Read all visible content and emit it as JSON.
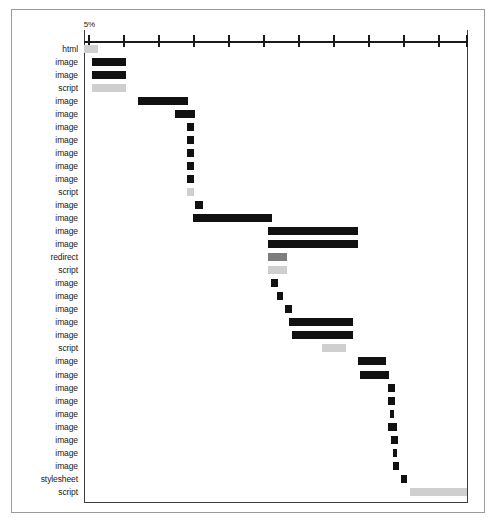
{
  "chart_data": {
    "type": "bar",
    "title": "",
    "subtitle": "",
    "xlabel": "",
    "ylabel": "",
    "orientation": "horizontal",
    "style": "waterfall-gantt",
    "grid": false,
    "legend": null,
    "axis": {
      "position": "top",
      "tick_labels": [
        "5%"
      ],
      "labeled_tick_index": 0,
      "tick_count": 12,
      "tick_positions_pct": [
        1.0,
        10.1,
        19.3,
        28.4,
        37.5,
        46.6,
        55.7,
        64.8,
        74.0,
        83.1,
        92.2,
        99.5
      ],
      "xlim_pct": [
        0,
        100
      ]
    },
    "categories": [
      "html",
      "image",
      "image",
      "script",
      "image",
      "image",
      "image",
      "image",
      "image",
      "image",
      "image",
      "script",
      "image",
      "image",
      "image",
      "image",
      "redirect",
      "script",
      "image",
      "image",
      "image",
      "image",
      "image",
      "script",
      "image",
      "image",
      "image",
      "image",
      "image",
      "image",
      "image",
      "image",
      "image",
      "stylesheet",
      "script"
    ],
    "series": [
      {
        "name": "resource timing",
        "units": "percent of total page load time",
        "bars": [
          {
            "label": "html",
            "start_pct": 0.0,
            "end_pct": 3.6,
            "color": "#cfcfcf",
            "shade": "light"
          },
          {
            "label": "image",
            "start_pct": 2.1,
            "end_pct": 11.0,
            "color": "#111111",
            "shade": "dark"
          },
          {
            "label": "image",
            "start_pct": 2.1,
            "end_pct": 11.0,
            "color": "#111111",
            "shade": "dark"
          },
          {
            "label": "script",
            "start_pct": 2.1,
            "end_pct": 11.0,
            "color": "#cfcfcf",
            "shade": "light"
          },
          {
            "label": "image",
            "start_pct": 14.1,
            "end_pct": 27.1,
            "color": "#111111",
            "shade": "dark"
          },
          {
            "label": "image",
            "start_pct": 23.7,
            "end_pct": 28.9,
            "color": "#111111",
            "shade": "dark"
          },
          {
            "label": "image",
            "start_pct": 26.8,
            "end_pct": 28.6,
            "color": "#111111",
            "shade": "dark"
          },
          {
            "label": "image",
            "start_pct": 26.8,
            "end_pct": 28.6,
            "color": "#111111",
            "shade": "dark"
          },
          {
            "label": "image",
            "start_pct": 26.8,
            "end_pct": 28.6,
            "color": "#111111",
            "shade": "dark"
          },
          {
            "label": "image",
            "start_pct": 26.8,
            "end_pct": 28.6,
            "color": "#111111",
            "shade": "dark"
          },
          {
            "label": "image",
            "start_pct": 26.8,
            "end_pct": 28.6,
            "color": "#111111",
            "shade": "dark"
          },
          {
            "label": "script",
            "start_pct": 26.8,
            "end_pct": 28.6,
            "color": "#cfcfcf",
            "shade": "light"
          },
          {
            "label": "image",
            "start_pct": 28.9,
            "end_pct": 31.0,
            "color": "#111111",
            "shade": "dark"
          },
          {
            "label": "image",
            "start_pct": 28.4,
            "end_pct": 49.0,
            "color": "#111111",
            "shade": "dark"
          },
          {
            "label": "image",
            "start_pct": 47.9,
            "end_pct": 71.4,
            "color": "#111111",
            "shade": "dark"
          },
          {
            "label": "image",
            "start_pct": 47.9,
            "end_pct": 71.4,
            "color": "#111111",
            "shade": "dark"
          },
          {
            "label": "redirect",
            "start_pct": 47.9,
            "end_pct": 52.9,
            "color": "#7d7d7d",
            "shade": "mid"
          },
          {
            "label": "script",
            "start_pct": 47.9,
            "end_pct": 52.9,
            "color": "#cfcfcf",
            "shade": "light"
          },
          {
            "label": "image",
            "start_pct": 48.7,
            "end_pct": 50.5,
            "color": "#111111",
            "shade": "dark"
          },
          {
            "label": "image",
            "start_pct": 50.3,
            "end_pct": 51.8,
            "color": "#111111",
            "shade": "dark"
          },
          {
            "label": "image",
            "start_pct": 52.3,
            "end_pct": 54.2,
            "color": "#111111",
            "shade": "dark"
          },
          {
            "label": "image",
            "start_pct": 53.4,
            "end_pct": 70.1,
            "color": "#111111",
            "shade": "dark"
          },
          {
            "label": "image",
            "start_pct": 54.2,
            "end_pct": 70.1,
            "color": "#111111",
            "shade": "dark"
          },
          {
            "label": "script",
            "start_pct": 62.0,
            "end_pct": 68.2,
            "color": "#cfcfcf",
            "shade": "light"
          },
          {
            "label": "image",
            "start_pct": 71.4,
            "end_pct": 78.6,
            "color": "#111111",
            "shade": "dark"
          },
          {
            "label": "image",
            "start_pct": 71.9,
            "end_pct": 79.4,
            "color": "#111111",
            "shade": "dark"
          },
          {
            "label": "image",
            "start_pct": 79.2,
            "end_pct": 81.0,
            "color": "#111111",
            "shade": "dark"
          },
          {
            "label": "image",
            "start_pct": 79.2,
            "end_pct": 81.0,
            "color": "#111111",
            "shade": "dark"
          },
          {
            "label": "image",
            "start_pct": 79.7,
            "end_pct": 80.7,
            "color": "#111111",
            "shade": "dark"
          },
          {
            "label": "image",
            "start_pct": 79.2,
            "end_pct": 81.5,
            "color": "#111111",
            "shade": "dark"
          },
          {
            "label": "image",
            "start_pct": 80.0,
            "end_pct": 81.8,
            "color": "#111111",
            "shade": "dark"
          },
          {
            "label": "image",
            "start_pct": 80.5,
            "end_pct": 81.5,
            "color": "#111111",
            "shade": "dark"
          },
          {
            "label": "image",
            "start_pct": 80.5,
            "end_pct": 82.0,
            "color": "#111111",
            "shade": "dark"
          },
          {
            "label": "stylesheet",
            "start_pct": 82.6,
            "end_pct": 84.1,
            "color": "#111111",
            "shade": "dark"
          },
          {
            "label": "script",
            "start_pct": 84.9,
            "end_pct": 99.7,
            "color": "#cfcfcf",
            "shade": "light"
          }
        ]
      }
    ],
    "colors": {
      "dark": "#111111",
      "mid": "#7d7d7d",
      "light": "#cfcfcf",
      "axis": "#1a1a1a",
      "frame": "#9a9a9a",
      "background": "#ffffff"
    }
  }
}
